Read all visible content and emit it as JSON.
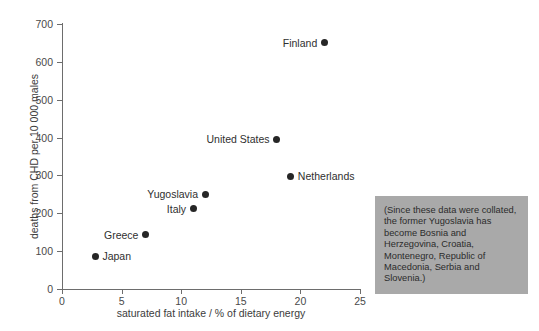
{
  "chart_data": {
    "type": "scatter",
    "title": "",
    "xlabel": "saturated fat intake / % of dietary energy",
    "ylabel": "deaths from CHD per 10 000 males",
    "xlim": [
      0,
      25
    ],
    "ylim": [
      0,
      700
    ],
    "xticks": [
      0,
      5,
      10,
      15,
      20,
      25
    ],
    "yticks": [
      0,
      100,
      200,
      300,
      400,
      500,
      600,
      700
    ],
    "grid": false,
    "legend": "none",
    "points": [
      {
        "label": "Japan",
        "x": 2.8,
        "y": 87,
        "label_side": "right"
      },
      {
        "label": "Greece",
        "x": 7.0,
        "y": 143,
        "label_side": "left"
      },
      {
        "label": "Italy",
        "x": 11.0,
        "y": 212,
        "label_side": "left"
      },
      {
        "label": "Yugoslavia",
        "x": 12.0,
        "y": 250,
        "label_side": "left"
      },
      {
        "label": "United States",
        "x": 18.0,
        "y": 395,
        "label_side": "left"
      },
      {
        "label": "Netherlands",
        "x": 19.2,
        "y": 298,
        "label_side": "right"
      },
      {
        "label": "Finland",
        "x": 22.0,
        "y": 650,
        "label_side": "left"
      }
    ]
  },
  "note": {
    "text": "(Since these data were collated, the former Yugoslavia has become Bosnia and Herzegovina, Croatia, Montenegro, Republic of Macedonia, Serbia and Slovenia.)",
    "background_color": "#a9a9a9"
  },
  "colors": {
    "point": "#262626",
    "axis": "#6d6d6d",
    "text": "#3a3a3a",
    "background": "#ffffff"
  }
}
